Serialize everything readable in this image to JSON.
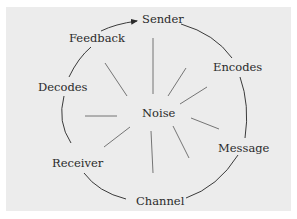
{
  "diagram": {
    "type": "communication-process-cycle",
    "center_label": "Noise",
    "nodes": [
      {
        "id": "sender",
        "label": "Sender"
      },
      {
        "id": "encodes",
        "label": "Encodes"
      },
      {
        "id": "message",
        "label": "Message"
      },
      {
        "id": "channel",
        "label": "Channel"
      },
      {
        "id": "receiver",
        "label": "Receiver"
      },
      {
        "id": "decodes",
        "label": "Decodes"
      },
      {
        "id": "feedback",
        "label": "Feedback"
      }
    ],
    "flow": "clockwise circle from Sender through Encodes, Message, Channel, Receiver, Decodes, Feedback, back to Sender (arrowhead into Sender)",
    "noise_rays": 10,
    "colors": {
      "background": "#ececec",
      "line": "#3a3a3a",
      "ray": "#555555",
      "text": "#2a2a2a"
    }
  }
}
